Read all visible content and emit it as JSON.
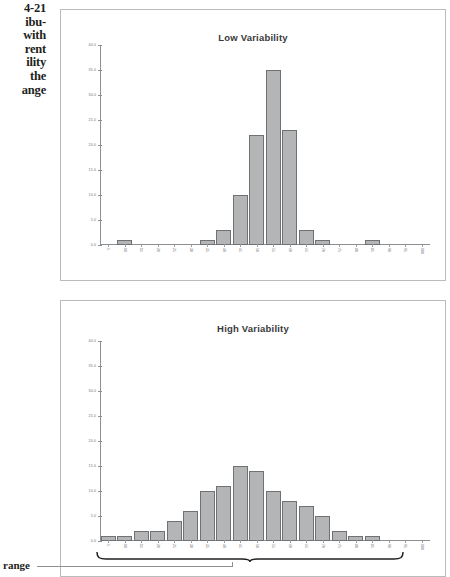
{
  "figure": {
    "caption_lines": [
      "4-21",
      "ibu-",
      "with",
      "rent",
      "ility",
      "the",
      "ange"
    ],
    "range_label": "range"
  },
  "chart_data": [
    {
      "type": "bar",
      "title": "Low Variability",
      "xlabel": "",
      "ylabel": "",
      "ylim": [
        0.0,
        40.0
      ],
      "yticks": [
        "0.0",
        "5.0",
        "10.0",
        "15.0",
        "20.0",
        "25.0",
        "30.0",
        "35.0",
        "40.0"
      ],
      "ytick_values": [
        0,
        5,
        10,
        15,
        20,
        25,
        30,
        35,
        40
      ],
      "grid": false,
      "legend": null,
      "categories": [
        "5",
        "10",
        "15",
        "20",
        "25",
        "30",
        "35",
        "40",
        "45",
        "50",
        "55",
        "60",
        "65",
        "70",
        "75",
        "80",
        "85",
        "90",
        "95",
        "100"
      ],
      "values": [
        0,
        1,
        0,
        0,
        0,
        0,
        1,
        3,
        10,
        22,
        35,
        23,
        3,
        1,
        0,
        0,
        1,
        0,
        0,
        0
      ]
    },
    {
      "type": "bar",
      "title": "High Variability",
      "xlabel": "",
      "ylabel": "",
      "ylim": [
        0.0,
        40.0
      ],
      "yticks": [
        "0.0",
        "5.0",
        "10.0",
        "15.0",
        "20.0",
        "25.0",
        "30.0",
        "35.0",
        "40.0"
      ],
      "ytick_values": [
        0,
        5,
        10,
        15,
        20,
        25,
        30,
        35,
        40
      ],
      "grid": false,
      "legend": null,
      "categories": [
        "5",
        "10",
        "15",
        "20",
        "25",
        "30",
        "35",
        "40",
        "45",
        "50",
        "55",
        "60",
        "65",
        "70",
        "75",
        "80",
        "85",
        "90",
        "95",
        "100"
      ],
      "values": [
        1,
        1,
        2,
        2,
        4,
        6,
        10,
        11,
        15,
        14,
        10,
        8,
        7,
        5,
        2,
        1,
        1,
        0,
        0,
        0
      ]
    }
  ]
}
